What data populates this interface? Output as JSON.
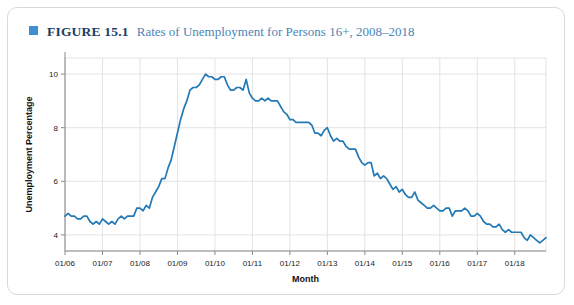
{
  "figure": {
    "number_label": "FIGURE 15.1",
    "caption": "Rates of Unemployment for Persons 16+, 2008–2018",
    "bullet_color": "#3f8ecd",
    "number_color": "#1a3e63",
    "caption_color": "#4a85b5"
  },
  "chart_data": {
    "type": "line",
    "title": "Rates of Unemployment for Persons 16+, 2008–2018",
    "xlabel": "Month",
    "ylabel": "Unemployment Percentage",
    "line_color": "#2279b5",
    "grid": true,
    "legend": "none",
    "ylim": [
      3.4,
      10.6
    ],
    "yticks": [
      4,
      6,
      8,
      10
    ],
    "ytick_labels": [
      "4",
      "6",
      "8",
      "10"
    ],
    "xlim": [
      "01/06",
      "01/18"
    ],
    "xticks": [
      "01/06",
      "01/07",
      "01/08",
      "01/09",
      "01/10",
      "01/11",
      "01/12",
      "01/13",
      "01/14",
      "01/15",
      "01/16",
      "01/17",
      "01/18"
    ],
    "x_start_year": 2006,
    "x_points": 151,
    "series": [
      {
        "name": "Unemployment rate, persons 16+",
        "values": [
          4.7,
          4.8,
          4.7,
          4.7,
          4.6,
          4.6,
          4.7,
          4.7,
          4.5,
          4.4,
          4.5,
          4.4,
          4.6,
          4.5,
          4.4,
          4.5,
          4.4,
          4.6,
          4.7,
          4.6,
          4.7,
          4.7,
          4.7,
          5.0,
          5.0,
          4.9,
          5.1,
          5.0,
          5.4,
          5.6,
          5.8,
          6.1,
          6.1,
          6.5,
          6.8,
          7.3,
          7.8,
          8.3,
          8.7,
          9.0,
          9.4,
          9.5,
          9.5,
          9.6,
          9.8,
          10.0,
          9.9,
          9.9,
          9.8,
          9.8,
          9.9,
          9.9,
          9.6,
          9.4,
          9.4,
          9.5,
          9.5,
          9.4,
          9.8,
          9.3,
          9.1,
          9.0,
          9.0,
          9.1,
          9.0,
          9.1,
          9.0,
          9.0,
          9.0,
          8.8,
          8.6,
          8.5,
          8.3,
          8.3,
          8.2,
          8.2,
          8.2,
          8.2,
          8.2,
          8.1,
          7.8,
          7.8,
          7.7,
          7.9,
          8.0,
          7.7,
          7.5,
          7.6,
          7.5,
          7.5,
          7.3,
          7.2,
          7.2,
          7.2,
          6.9,
          6.7,
          6.6,
          6.7,
          6.7,
          6.2,
          6.3,
          6.1,
          6.2,
          6.1,
          5.9,
          5.7,
          5.8,
          5.6,
          5.7,
          5.5,
          5.4,
          5.4,
          5.6,
          5.3,
          5.2,
          5.1,
          5.0,
          5.0,
          5.1,
          5.0,
          4.9,
          4.9,
          5.0,
          5.0,
          4.7,
          4.9,
          4.9,
          4.9,
          5.0,
          4.9,
          4.7,
          4.7,
          4.8,
          4.7,
          4.5,
          4.4,
          4.4,
          4.3,
          4.3,
          4.4,
          4.2,
          4.1,
          4.2,
          4.1,
          4.1,
          4.1,
          4.1,
          3.9,
          3.8,
          4.0,
          3.9,
          3.8,
          3.7,
          3.8,
          3.9
        ]
      }
    ]
  }
}
